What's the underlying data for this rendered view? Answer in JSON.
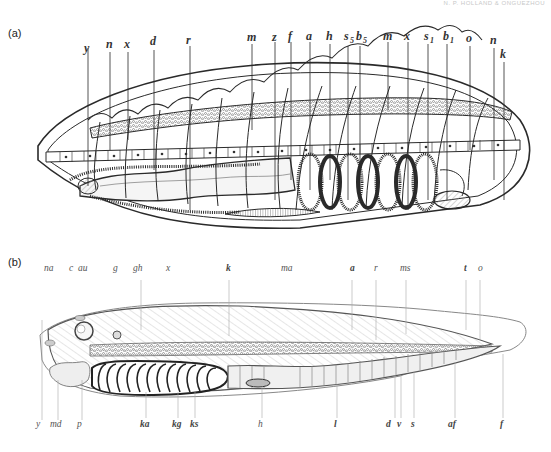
{
  "header": {
    "running_title": "N. P. HOLLAND & ONGUEZHOU"
  },
  "figure": {
    "panels": [
      {
        "id": "a",
        "label": "(a)",
        "top_labels": [
          "y",
          "n",
          "x",
          "d",
          "r",
          "m",
          "z",
          "f",
          "a",
          "h",
          "s5",
          "b5",
          "m",
          "x",
          "s1",
          "b1",
          "o",
          "n",
          "k"
        ],
        "subscripts": {
          "s5": [
            "s",
            "5"
          ],
          "b5": [
            "b",
            "5"
          ],
          "s1": [
            "s",
            "1"
          ],
          "b1": [
            "b",
            "1"
          ]
        }
      },
      {
        "id": "b",
        "label": "(b)",
        "top_labels": [
          "na",
          "c",
          "au",
          "g",
          "gh",
          "x",
          "k",
          "ma",
          "a",
          "r",
          "ms",
          "t",
          "o"
        ],
        "bottom_labels": [
          "y",
          "md",
          "p",
          "ka",
          "kg",
          "ks",
          "h",
          "l",
          "d",
          "v",
          "s",
          "af",
          "f"
        ]
      }
    ]
  },
  "colors": {
    "ink": "#2a2a2a",
    "faint_ink": "#888888",
    "paper": "#ffffff",
    "shade": "#9a9a9a"
  }
}
